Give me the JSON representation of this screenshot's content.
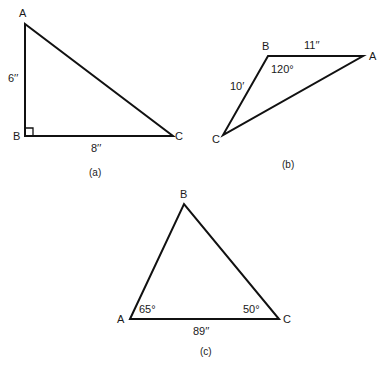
{
  "figure_a": {
    "caption": "(a)",
    "vertices": {
      "A": "A",
      "B": "B",
      "C": "C"
    },
    "side_AB": "6′′",
    "side_BC": "8′′",
    "right_angle_at": "B"
  },
  "figure_b": {
    "caption": "(b)",
    "vertices": {
      "A": "A",
      "B": "B",
      "C": "C"
    },
    "side_BA": "11′′",
    "side_BC": "10′",
    "angle_B": "120°"
  },
  "figure_c": {
    "caption": "(c)",
    "vertices": {
      "A": "A",
      "B": "B",
      "C": "C"
    },
    "side_AC": "89′′",
    "angle_A": "65°",
    "angle_C": "50°"
  },
  "colors": {
    "stroke": "#111111",
    "text": "#1a1a1a",
    "background": "#ffffff"
  }
}
